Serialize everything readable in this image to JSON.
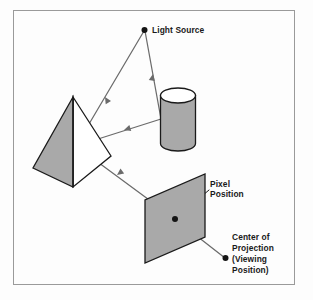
{
  "figure": {
    "background_color": "#fdfdfd",
    "border_color": "#9a9a9a",
    "shape_fill": "#a9a9a9",
    "shape_stroke": "#1a1a1a",
    "ray_color": "#6b6b6b",
    "dot_color": "#141414",
    "text_color": "#1a1a1a"
  },
  "labels": {
    "light_source": "Light Source",
    "pixel_position_line1": "Pixel",
    "pixel_position_line2": "Position",
    "center_of_projection_line1": "Center of",
    "center_of_projection_line2": "Projection",
    "center_of_projection_line3": "(Viewing",
    "center_of_projection_line4": "Position)"
  },
  "points": {
    "light_source": {
      "x": 144,
      "y": 30
    },
    "pixel_position": {
      "x": 175,
      "y": 219
    },
    "center_of_projection": {
      "x": 225,
      "y": 258
    }
  },
  "objects": [
    {
      "name": "pyramid",
      "apex": {
        "x": 73,
        "y": 97
      }
    },
    {
      "name": "cylinder",
      "center": {
        "x": 177,
        "y": 119
      }
    },
    {
      "name": "projection-plane",
      "center": {
        "x": 175,
        "y": 218
      }
    }
  ]
}
